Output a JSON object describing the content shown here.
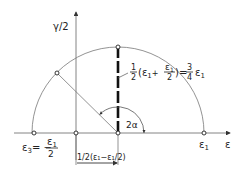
{
  "diagram": {
    "axes": {
      "vertical_label": "γ/2",
      "horizontal_label": "ε"
    },
    "points": {
      "eps1_label": "ε",
      "eps1_sub": "1",
      "eps3_label": "ε",
      "eps3_sub": "3",
      "eps3_value_lhs": "= −",
      "eps3_num": "ε",
      "eps3_num_sub": "1",
      "eps3_den": "2"
    },
    "annotations": {
      "shear_half": "1",
      "shear_half_den": "2",
      "shear_expr_open": "(ε",
      "shear_expr_sub1": "1",
      "shear_expr_plus": "+",
      "shear_frac_num": "ε",
      "shear_frac_num_sub": "1",
      "shear_frac_den": "2",
      "shear_expr_close": ")",
      "shear_equals": "=",
      "shear_result_num": "3",
      "shear_result_den": "4",
      "shear_result_eps": "ε",
      "shear_result_sub": "1",
      "dimension_label": "1/2(ε₁−ε₁/2)",
      "angle_label": "2α"
    },
    "colors": {
      "line": "#555555",
      "bold_line": "#111111",
      "text": "#222222"
    }
  }
}
